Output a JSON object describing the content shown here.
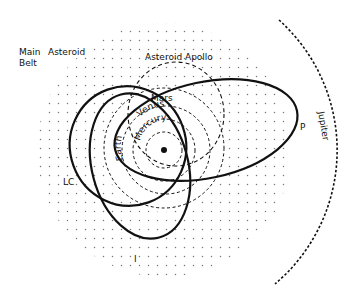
{
  "diagram": {
    "colors": {
      "background": "#ffffff",
      "ink": "#111111",
      "dots": "#777777"
    },
    "sun": {
      "label": ""
    },
    "labels": {
      "main_belt_line1": "Main",
      "main_belt_line2": "Belt",
      "asteroid_left": "Asteroid",
      "asteroid_apollo": "Asteroid  Apollo",
      "mars": "Mars",
      "earth": "Earth",
      "venus": "Venus",
      "mercury": "Mercury",
      "jupiter": "Jupiter",
      "orbit_p": "P",
      "orbit_lc": "LC",
      "orbit_i": "I"
    }
  }
}
